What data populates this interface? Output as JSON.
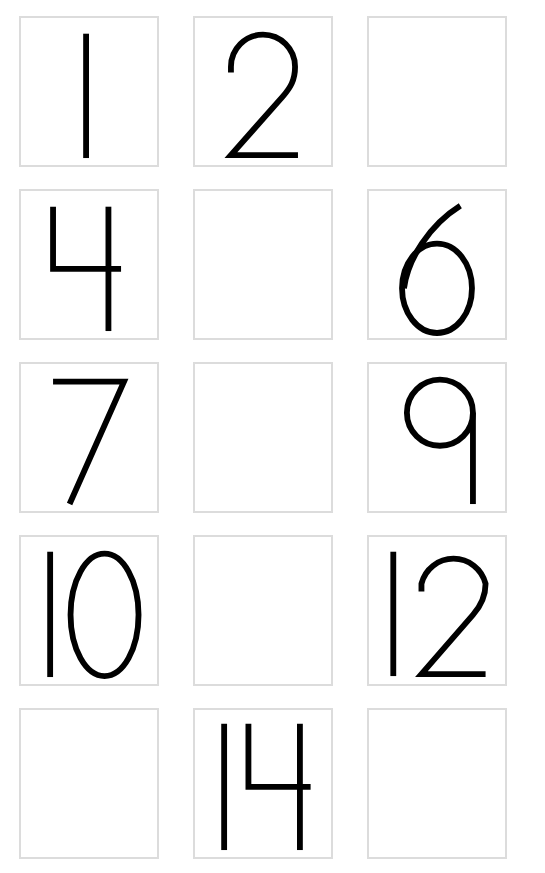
{
  "worksheet": {
    "boxes": [
      {
        "row": 1,
        "col": 1,
        "value": "1"
      },
      {
        "row": 1,
        "col": 2,
        "value": "2"
      },
      {
        "row": 1,
        "col": 3,
        "value": ""
      },
      {
        "row": 2,
        "col": 1,
        "value": "4"
      },
      {
        "row": 2,
        "col": 2,
        "value": ""
      },
      {
        "row": 2,
        "col": 3,
        "value": "6"
      },
      {
        "row": 3,
        "col": 1,
        "value": "7"
      },
      {
        "row": 3,
        "col": 2,
        "value": ""
      },
      {
        "row": 3,
        "col": 3,
        "value": "9"
      },
      {
        "row": 4,
        "col": 1,
        "value": "10"
      },
      {
        "row": 4,
        "col": 2,
        "value": ""
      },
      {
        "row": 4,
        "col": 3,
        "value": "12"
      },
      {
        "row": 5,
        "col": 1,
        "value": ""
      },
      {
        "row": 5,
        "col": 2,
        "value": "14"
      },
      {
        "row": 5,
        "col": 3,
        "value": ""
      }
    ]
  },
  "colors": {
    "box_border": "#dcdcdc",
    "digit": "#000000",
    "background": "#ffffff"
  }
}
